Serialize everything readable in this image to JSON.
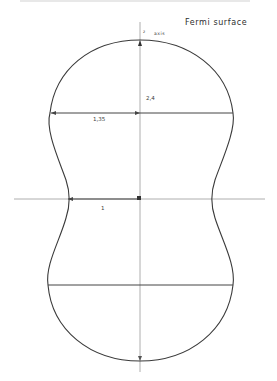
{
  "diagram": {
    "title": "Fermi surface",
    "axis_label": {
      "symbol": "z",
      "text": "axis"
    },
    "dimensions": {
      "height_label": "2,4",
      "half_width_label": "1,35",
      "neck_radius_label": "1"
    },
    "colors": {
      "curve": "#3a3a3a",
      "axes": "#9a9a9a",
      "background": "#ffffff"
    },
    "geometry": {
      "center": [
        140,
        199
      ],
      "top_y": 40,
      "bottom_y": 361,
      "upper_chord_y": 113,
      "lower_chord_y": 285,
      "max_half_width_ratio": 1.35,
      "neck_half_width_ratio": 1
    }
  }
}
